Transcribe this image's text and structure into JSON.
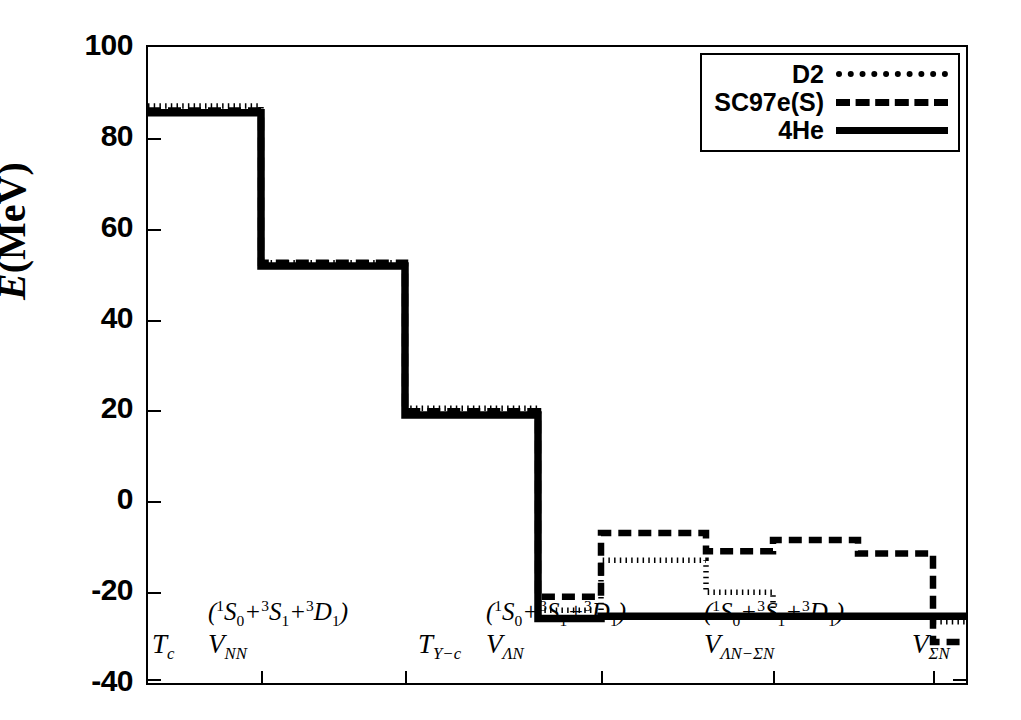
{
  "axes": {
    "ylabel_italic": "E",
    "ylabel_rest": "(MeV)",
    "yticks": [
      100,
      80,
      60,
      40,
      20,
      0,
      -20,
      -40
    ],
    "ylim": [
      -40,
      100
    ]
  },
  "legend": {
    "entries": [
      {
        "label": "D2",
        "style": "dotted"
      },
      {
        "label": "SC97e(S)",
        "style": "dashed"
      },
      {
        "label": "4He",
        "style": "solid"
      }
    ]
  },
  "xgroups": [
    {
      "top": "",
      "bottom_v": "T",
      "bottom_sub": "c"
    },
    {
      "top": "(¹S₀+³S₁+³D₁)",
      "bottom_v": "V",
      "bottom_sub": "NN"
    },
    {
      "top": "",
      "bottom_v": "T",
      "bottom_sub": "Y−c"
    },
    {
      "top": "(¹S₀+³S₁+³D₁)",
      "bottom_v": "V",
      "bottom_sub": "ΛN"
    },
    {
      "top": "(¹S₀+³S₁+³D₁)",
      "bottom_v": "V",
      "bottom_sub": "ΛN−ΣN"
    },
    {
      "top": "",
      "bottom_v": "V",
      "bottom_sub": "ΣN"
    }
  ],
  "chart_data": {
    "type": "line",
    "title": "",
    "xlabel": "",
    "ylabel": "E(MeV)",
    "ylim": [
      -40,
      100
    ],
    "grid": false,
    "legend_position": "top-right",
    "x_category_labels": [
      "T_c",
      "V_NN (1S0+3S1+3D1)",
      "T_Y-c",
      "V_LN (1S0+3S1+3D1)",
      "V_LN-SN (1S0+3S1+3D1)",
      "V_SN"
    ],
    "x_breakpoints": [
      0,
      113,
      257,
      390,
      453,
      558,
      625,
      710,
      785,
      822
    ],
    "series": [
      {
        "name": "D2",
        "style": "dotted",
        "step_values": [
          87.0,
          52.5,
          20.5,
          -24.0,
          -13.0,
          -20.0,
          -25.5,
          -25.5,
          -26.5,
          -28.0
        ]
      },
      {
        "name": "SC97e(S)",
        "style": "dashed",
        "step_values": [
          86.0,
          52.5,
          19.8,
          -21.0,
          -7.0,
          -11.0,
          -8.5,
          -11.5,
          -31.0,
          -28.5
        ]
      },
      {
        "name": "4He",
        "style": "solid",
        "step_values": [
          85.5,
          51.8,
          19.0,
          -25.8,
          -25.3,
          -25.3,
          -25.3,
          -25.3,
          -25.3,
          -25.3
        ]
      }
    ]
  }
}
